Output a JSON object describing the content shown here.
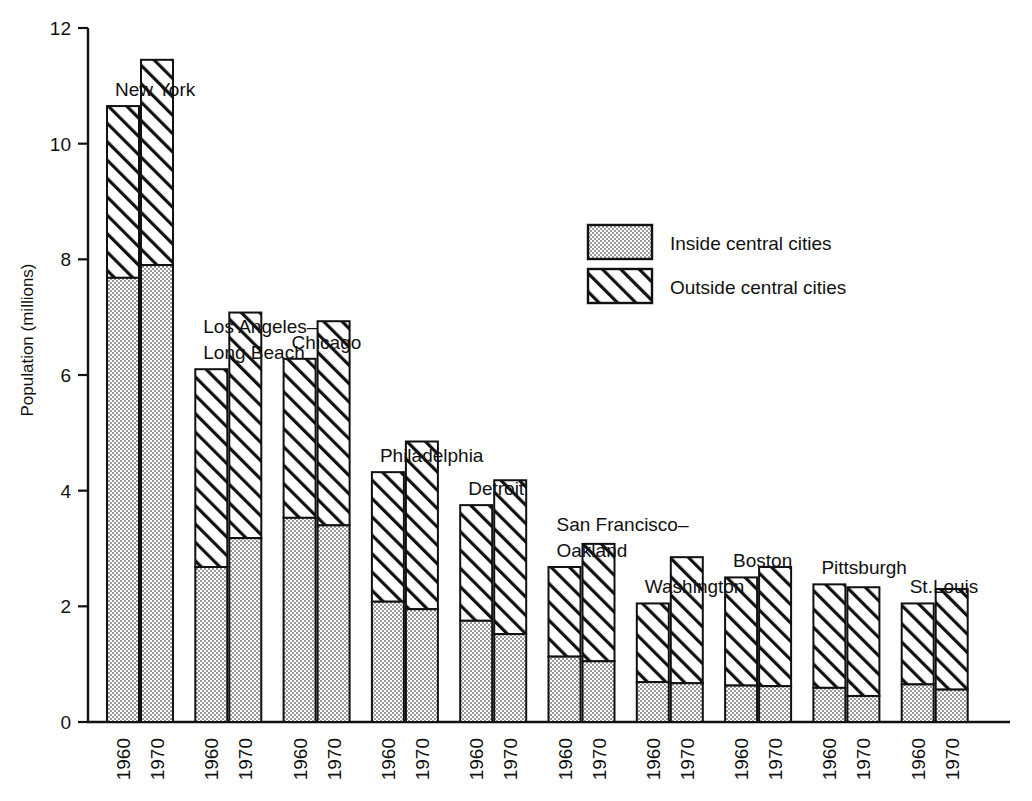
{
  "chart_data": {
    "type": "bar",
    "subtype": "grouped-stacked",
    "title": "",
    "xlabel": "",
    "ylabel": "Population (millions)",
    "ylim": [
      0,
      12
    ],
    "ytick_values": [
      0,
      2,
      4,
      6,
      8,
      10,
      12
    ],
    "ytick_labels": [
      "0",
      "2",
      "4",
      "6",
      "8",
      "10",
      "12"
    ],
    "grid": false,
    "legend_position": "upper-right-inside",
    "series": [
      {
        "name": "Inside central cities",
        "pattern": "stipple"
      },
      {
        "name": "Outside central cities",
        "pattern": "diagonal-hatch"
      }
    ],
    "year_labels": [
      "1960",
      "1970"
    ],
    "categories": [
      "New York",
      "Los Angeles–Long Beach",
      "Chicago",
      "Philadelphia",
      "Detroit",
      "San Francisco–Oakland",
      "Washington",
      "Boston",
      "Pittsburgh",
      "St.Louis"
    ],
    "groups": [
      {
        "category": "New York",
        "label_lines": [
          "New York"
        ],
        "bars": [
          {
            "year": "1960",
            "inside": 7.68,
            "outside": 2.97,
            "total": 10.65
          },
          {
            "year": "1970",
            "inside": 7.9,
            "outside": 3.55,
            "total": 11.45
          }
        ]
      },
      {
        "category": "Los Angeles–Long Beach",
        "label_lines": [
          "Los Angeles–",
          "Long Beach"
        ],
        "bars": [
          {
            "year": "1960",
            "inside": 2.68,
            "outside": 3.42,
            "total": 6.1
          },
          {
            "year": "1970",
            "inside": 3.18,
            "outside": 3.9,
            "total": 7.08
          }
        ]
      },
      {
        "category": "Chicago",
        "label_lines": [
          "Chicago"
        ],
        "bars": [
          {
            "year": "1960",
            "inside": 3.53,
            "outside": 2.75,
            "total": 6.28
          },
          {
            "year": "1970",
            "inside": 3.4,
            "outside": 3.53,
            "total": 6.93
          }
        ]
      },
      {
        "category": "Philadelphia",
        "label_lines": [
          "Philadelphia"
        ],
        "bars": [
          {
            "year": "1960",
            "inside": 2.08,
            "outside": 2.24,
            "total": 4.32
          },
          {
            "year": "1970",
            "inside": 1.95,
            "outside": 2.9,
            "total": 4.85
          }
        ]
      },
      {
        "category": "Detroit",
        "label_lines": [
          "Detroit"
        ],
        "bars": [
          {
            "year": "1960",
            "inside": 1.75,
            "outside": 2.0,
            "total": 3.75
          },
          {
            "year": "1970",
            "inside": 1.52,
            "outside": 2.66,
            "total": 4.18
          }
        ]
      },
      {
        "category": "San Francisco–Oakland",
        "label_lines": [
          "San Francisco–",
          "Oakland"
        ],
        "bars": [
          {
            "year": "1960",
            "inside": 1.13,
            "outside": 1.55,
            "total": 2.68
          },
          {
            "year": "1970",
            "inside": 1.05,
            "outside": 2.03,
            "total": 3.08
          }
        ]
      },
      {
        "category": "Washington",
        "label_lines": [
          "Washington"
        ],
        "bars": [
          {
            "year": "1960",
            "inside": 0.69,
            "outside": 1.36,
            "total": 2.05
          },
          {
            "year": "1970",
            "inside": 0.67,
            "outside": 2.18,
            "total": 2.85
          }
        ]
      },
      {
        "category": "Boston",
        "label_lines": [
          "Boston"
        ],
        "bars": [
          {
            "year": "1960",
            "inside": 0.63,
            "outside": 1.87,
            "total": 2.5
          },
          {
            "year": "1970",
            "inside": 0.62,
            "outside": 2.06,
            "total": 2.68
          }
        ]
      },
      {
        "category": "Pittsburgh",
        "label_lines": [
          "Pittsburgh"
        ],
        "bars": [
          {
            "year": "1960",
            "inside": 0.59,
            "outside": 1.79,
            "total": 2.38
          },
          {
            "year": "1970",
            "inside": 0.45,
            "outside": 1.88,
            "total": 2.33
          }
        ]
      },
      {
        "category": "St.Louis",
        "label_lines": [
          "St.Louis"
        ],
        "bars": [
          {
            "year": "1960",
            "inside": 0.65,
            "outside": 1.4,
            "total": 2.05
          },
          {
            "year": "1970",
            "inside": 0.56,
            "outside": 1.74,
            "total": 2.3
          }
        ]
      }
    ]
  },
  "legend": {
    "items": [
      {
        "label": "Inside central cities",
        "pattern": "stipple"
      },
      {
        "label": "Outside central cities",
        "pattern": "diagonal-hatch"
      }
    ]
  },
  "colors": {
    "ink": "#111111",
    "background": "#ffffff",
    "inside_fill": "#e8e8e8",
    "outside_fill": "#ffffff"
  }
}
